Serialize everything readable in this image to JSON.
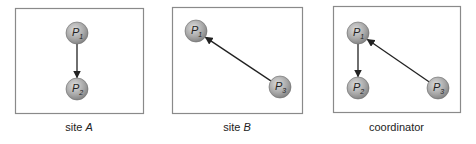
{
  "figure": {
    "panels": [
      {
        "id": "siteA",
        "caption_prefix": "site ",
        "caption_var": "A",
        "box": {
          "x": 15,
          "y": 8,
          "w": 128,
          "h": 105
        },
        "nodes": [
          {
            "id": "P1",
            "base": "P",
            "sub": "1",
            "cx": 77,
            "cy": 33
          },
          {
            "id": "P2",
            "base": "P",
            "sub": "2",
            "cx": 77,
            "cy": 89
          }
        ],
        "edges": [
          {
            "from": "P1",
            "to": "P2"
          }
        ]
      },
      {
        "id": "siteB",
        "caption_prefix": "site ",
        "caption_var": "B",
        "box": {
          "x": 172,
          "y": 7,
          "w": 130,
          "h": 106
        },
        "nodes": [
          {
            "id": "P1",
            "base": "P",
            "sub": "1",
            "cx": 196,
            "cy": 31
          },
          {
            "id": "P3",
            "base": "P",
            "sub": "3",
            "cx": 280,
            "cy": 87
          }
        ],
        "edges": [
          {
            "from": "P3",
            "to": "P1"
          }
        ]
      },
      {
        "id": "coordinator",
        "caption_prefix": "coordinator",
        "caption_var": "",
        "box": {
          "x": 333,
          "y": 6,
          "w": 127,
          "h": 106
        },
        "nodes": [
          {
            "id": "P1",
            "base": "P",
            "sub": "1",
            "cx": 358,
            "cy": 33
          },
          {
            "id": "P2",
            "base": "P",
            "sub": "2",
            "cx": 358,
            "cy": 88
          },
          {
            "id": "P3",
            "base": "P",
            "sub": "3",
            "cx": 438,
            "cy": 88
          }
        ],
        "edges": [
          {
            "from": "P1",
            "to": "P2"
          },
          {
            "from": "P3",
            "to": "P1"
          }
        ]
      }
    ],
    "colors": {
      "node_fill_light": "#d8d8d8",
      "node_fill_dark": "#8c8c8c",
      "node_stroke": "#6a6a6a",
      "box_stroke": "#8a8a8a",
      "edge": "#222222"
    }
  }
}
